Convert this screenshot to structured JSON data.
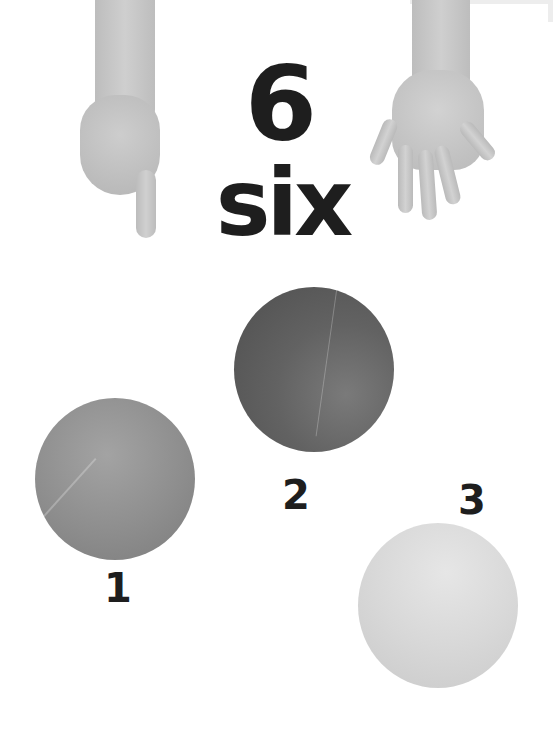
{
  "page": {
    "numeral": "6",
    "word": "six"
  },
  "illustrations": {
    "left_hand": "hand-pointing-down",
    "right_hand": "open-hand-five-fingers"
  },
  "balls": [
    {
      "label": "1",
      "color": "#8e8e8e"
    },
    {
      "label": "2",
      "color": "#626262"
    },
    {
      "label": "3",
      "color": "#d8d8d8"
    }
  ]
}
